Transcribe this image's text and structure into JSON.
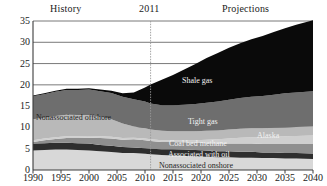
{
  "annotations": {
    "history": "History",
    "year_divider": "2011",
    "projections": "Projections"
  },
  "series_labels": {
    "shale_gas": "Shale gas",
    "tight_gas": "Tight gas",
    "alaska": "Alaska",
    "coal_bed_methane": "Coal bed methane",
    "associated_with_oil": "Associated with oil",
    "nonassociated_onshore": "Nonassociated onshore",
    "nonassociated_offshore": "Nonassociated offshore"
  },
  "colors": {
    "shale_gas": "#0a0a0a",
    "tight_gas": "#6e6e6e",
    "nonassociated_offshore": "#b9b9b9",
    "alaska": "#cfcfcf",
    "coal_bed_methane": "#8f8f8f",
    "associated_with_oil": "#2e2e2e",
    "nonassociated_onshore": "#d8d8d8",
    "axis": "#3c3c3c",
    "gridline": "#6a6a6a",
    "divider": "#9a9a9a",
    "background": "#ffffff"
  },
  "chart_data": {
    "type": "area",
    "title": "",
    "subtitle": "",
    "xlabel": "",
    "ylabel": "",
    "xlim": [
      1990,
      2040
    ],
    "ylim": [
      0,
      35
    ],
    "yticks": [
      0,
      5,
      10,
      15,
      20,
      25,
      30,
      35
    ],
    "xticks": [
      1990,
      1995,
      2000,
      2005,
      2010,
      2015,
      2020,
      2025,
      2030,
      2035,
      2040
    ],
    "grid": true,
    "legend_position": "inline-annotations",
    "stacked": true,
    "stack_order_bottom_to_top": [
      "Nonassociated onshore",
      "Associated with oil",
      "Coal bed methane",
      "Alaska",
      "Nonassociated offshore",
      "Tight gas",
      "Shale gas"
    ],
    "divider_year": 2011,
    "x": [
      1990,
      1992,
      1994,
      1996,
      1998,
      2000,
      2002,
      2004,
      2006,
      2008,
      2010,
      2011,
      2013,
      2015,
      2017,
      2019,
      2021,
      2023,
      2025,
      2027,
      2029,
      2031,
      2033,
      2035,
      2037,
      2040
    ],
    "series": [
      {
        "name": "Nonassociated onshore",
        "values": [
          4.6,
          4.7,
          4.8,
          4.8,
          4.7,
          4.6,
          4.4,
          4.2,
          4.0,
          4.0,
          3.8,
          3.7,
          3.5,
          3.4,
          3.3,
          3.2,
          3.1,
          3.0,
          3.0,
          2.9,
          2.9,
          2.8,
          2.8,
          2.7,
          2.7,
          2.6
        ]
      },
      {
        "name": "Associated with oil",
        "values": [
          1.6,
          1.6,
          1.6,
          1.6,
          1.6,
          1.6,
          1.5,
          1.5,
          1.4,
          1.3,
          1.3,
          1.3,
          1.4,
          1.5,
          1.5,
          1.5,
          1.5,
          1.4,
          1.4,
          1.4,
          1.4,
          1.3,
          1.3,
          1.3,
          1.3,
          1.3
        ]
      },
      {
        "name": "Coal bed methane",
        "values": [
          0.4,
          0.7,
          0.9,
          1.1,
          1.2,
          1.4,
          1.6,
          1.7,
          1.7,
          1.9,
          1.9,
          1.8,
          1.7,
          1.7,
          1.7,
          1.7,
          1.7,
          1.8,
          1.8,
          1.9,
          1.9,
          2.0,
          2.0,
          2.1,
          2.1,
          2.2
        ]
      },
      {
        "name": "Alaska",
        "values": [
          0.4,
          0.4,
          0.4,
          0.4,
          0.4,
          0.4,
          0.4,
          0.4,
          0.4,
          0.4,
          0.4,
          0.4,
          0.4,
          0.4,
          0.5,
          0.6,
          0.8,
          1.0,
          1.2,
          1.4,
          1.5,
          1.6,
          1.7,
          1.8,
          1.9,
          2.0
        ]
      },
      {
        "name": "Nonassociated offshore",
        "values": [
          4.9,
          4.9,
          5.0,
          5.1,
          5.0,
          4.9,
          4.6,
          4.1,
          3.4,
          2.6,
          2.4,
          2.3,
          2.2,
          2.1,
          2.1,
          2.1,
          2.1,
          2.1,
          2.1,
          2.1,
          2.1,
          2.1,
          2.1,
          2.1,
          2.1,
          2.1
        ]
      },
      {
        "name": "Tight gas",
        "values": [
          5.4,
          5.5,
          5.7,
          5.8,
          5.9,
          6.0,
          6.0,
          6.2,
          6.3,
          6.4,
          6.3,
          6.1,
          6.0,
          6.1,
          6.2,
          6.4,
          6.6,
          6.8,
          7.0,
          7.2,
          7.4,
          7.6,
          7.8,
          8.0,
          8.1,
          8.3
        ]
      },
      {
        "name": "Shale gas",
        "values": [
          0.2,
          0.2,
          0.2,
          0.3,
          0.3,
          0.3,
          0.4,
          0.5,
          0.8,
          1.6,
          3.3,
          4.5,
          6.0,
          7.1,
          8.3,
          9.4,
          10.5,
          11.4,
          12.2,
          12.9,
          13.5,
          14.1,
          14.7,
          15.3,
          15.9,
          16.7
        ]
      }
    ]
  }
}
